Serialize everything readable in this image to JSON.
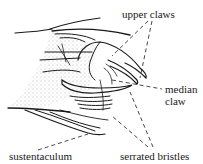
{
  "figure": {
    "labels": {
      "upper_claws": "upper claws",
      "median_claw_line1": "median",
      "median_claw_line2": "claw",
      "sustentaculum": "sustentaculum",
      "serrated_bristles": "serrated bristles"
    },
    "colors": {
      "ink": "#1a1a1a",
      "background": "#ffffff"
    }
  }
}
